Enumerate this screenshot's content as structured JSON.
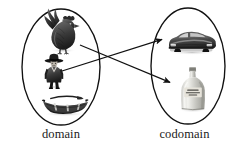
{
  "figure": {
    "type": "set-mapping-diagram",
    "width": 241,
    "height": 152,
    "background_color": "#ffffff",
    "ink_color": "#111111"
  },
  "sets": {
    "domain": {
      "label": "domain",
      "shape": "ellipse",
      "center_x": 61,
      "center_y": 67,
      "radius_x": 39,
      "radius_y": 58,
      "elements": [
        {
          "name": "rooster",
          "icon": "rooster-icon",
          "x": 45,
          "y": 16,
          "width": 36,
          "height": 35
        },
        {
          "name": "man-in-hat",
          "icon": "person-in-hat-icon",
          "x": 42,
          "y": 55,
          "width": 24,
          "height": 32
        },
        {
          "name": "rowboat",
          "icon": "rowboat-icon",
          "x": 42,
          "y": 95,
          "width": 47,
          "height": 21
        }
      ]
    },
    "codomain": {
      "label": "codomain",
      "shape": "ellipse",
      "center_x": 188,
      "center_y": 66,
      "radius_x": 37,
      "radius_y": 58,
      "elements": [
        {
          "name": "car",
          "icon": "car-icon",
          "x": 168,
          "y": 27,
          "width": 48,
          "height": 26
        },
        {
          "name": "bottle",
          "icon": "bottle-icon",
          "x": 180,
          "y": 67,
          "width": 27,
          "height": 44
        }
      ]
    }
  },
  "arrows": [
    {
      "name": "rooster-to-bottle",
      "from": "rooster",
      "to": "bottle",
      "x1": 80,
      "y1": 45,
      "x2": 172,
      "y2": 83
    },
    {
      "name": "man-to-car",
      "from": "man-in-hat",
      "to": "car",
      "x1": 62,
      "y1": 71,
      "x2": 164,
      "y2": 40
    }
  ]
}
